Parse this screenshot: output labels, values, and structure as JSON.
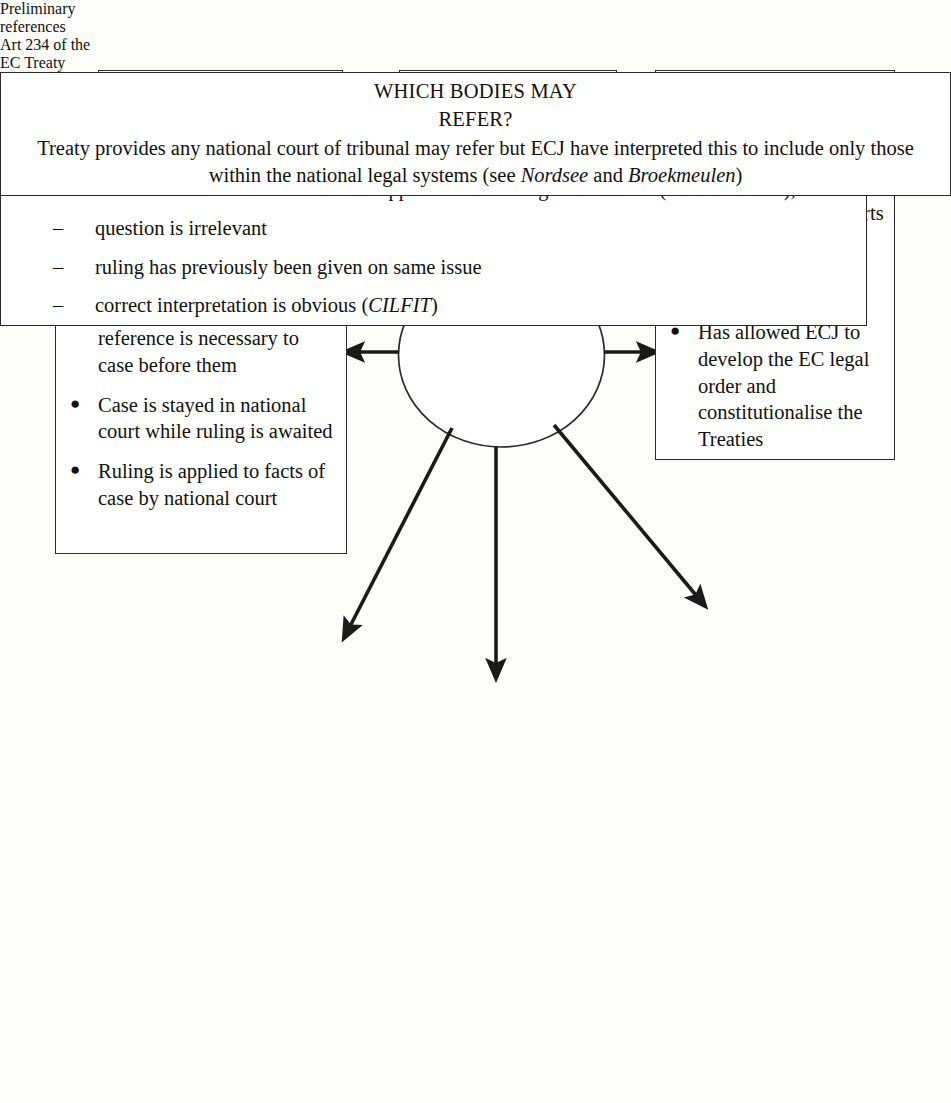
{
  "diagram": {
    "title": "Preliminary references Art 234 of the EC Treaty",
    "center": {
      "name": "center-node",
      "lines": [
        "Preliminary",
        "references",
        "Art 234 of the",
        "EC Treaty"
      ]
    },
    "nodes": {
      "purpose": {
        "heading": "PURPOSE:",
        "body_parts": [
          {
            "text": "To ensure ",
            "italic": false
          },
          {
            "text": "uniformity",
            "italic": true
          },
          {
            "text": " of interpretation and application of EC law",
            "italic": false
          }
        ],
        "body_plain": "To ensure uniformity of interpretation and application of EC law"
      },
      "effects": {
        "heading": "EFFECTS:",
        "body_plain": "Ruling provided by the ECJ binds the national court that referred"
      },
      "consequences": {
        "heading": "CONSEQUENCES:",
        "bullets": [
          "Creates a link between national courts and ECJ",
          "Allows national courts to familiarise themselves with EC law",
          "Has allowed ECJ to develop the EC legal order and constitutionalise the Treaties"
        ],
        "bullet_mark": "●"
      },
      "procedure": {
        "heading": "PROCEDURE:",
        "bullets": [
          "National court decides reference is necessary to case before them",
          "Case is stayed in national court while ruling is awaited",
          "Ruling is applied to facts of case by national court"
        ],
        "bullet_mark": "●"
      },
      "refuse": {
        "heading_line1": "CAN THE ECJ REFUSE A",
        "heading_line2": "REFERENCE?",
        "body_parts": [
          {
            "text": "Only if there has been an abuse of the reference procedure by the national court (see, for example, ",
            "italic": false
          },
          {
            "text": "Foglia Nos 1 and 2",
            "italic": true
          },
          {
            "text": " and ",
            "italic": false
          },
          {
            "text": "Meilicke",
            "italic": true
          },
          {
            "text": ")",
            "italic": false
          }
        ],
        "body_plain": "Only if there has been an abuse of the reference procedure by the national court (see, for example, Foglia Nos 1 and 2 and Meilicke)"
      },
      "must": {
        "heading_line1": "MUST A REFERENCE BE",
        "heading_line2": "MADE?",
        "bullet_mark": "●",
        "dash_mark": "–",
        "bullets": [
          {
            "parts": [
              {
                "text": "Lower courts have ",
                "italic": false
              },
              {
                "text": "discretion",
                "italic": true
              }
            ],
            "plain": "Lower courts have discretion"
          },
          {
            "parts": [
              {
                "text": "Courts from which there is no automatic appeal have an obligation to refer (",
                "italic": false
              },
              {
                "text": "Costa v ENEL",
                "italic": true
              },
              {
                "text": "), unless:",
                "italic": false
              }
            ],
            "plain": "Courts from which there is no automatic appeal have an obligation to refer (Costa v ENEL), unless:",
            "subbullets": [
              {
                "parts": [
                  {
                    "text": "question is irrelevant",
                    "italic": false
                  }
                ],
                "plain": "question is irrelevant"
              },
              {
                "parts": [
                  {
                    "text": "ruling has previously been given on same issue",
                    "italic": false
                  }
                ],
                "plain": "ruling has previously been given on same issue"
              },
              {
                "parts": [
                  {
                    "text": "correct interpretation is obvious (",
                    "italic": false
                  },
                  {
                    "text": "CILFIT",
                    "italic": true
                  },
                  {
                    "text": ")",
                    "italic": false
                  }
                ],
                "plain": "correct interpretation is obvious (CILFIT)"
              }
            ]
          }
        ]
      },
      "which": {
        "heading_line1": "WHICH BODIES MAY",
        "heading_line2": "REFER?",
        "body_parts": [
          {
            "text": "Treaty provides any national court of tribunal may refer but ECJ have interpreted this to include only those within the national legal systems (see ",
            "italic": false
          },
          {
            "text": "Nordsee",
            "italic": true
          },
          {
            "text": " and ",
            "italic": false
          },
          {
            "text": "Broekmeulen",
            "italic": true
          },
          {
            "text": ")",
            "italic": false
          }
        ],
        "body_plain": "Treaty provides any national court of tribunal may refer but ECJ have interpreted this to include only those within the national legal systems (see Nordsee and Broekmeulen)"
      }
    },
    "connectors": [
      {
        "name": "arrow-center-to-purpose",
        "from": "center",
        "to": "purpose",
        "direction": "up-left"
      },
      {
        "name": "arrow-center-to-effects",
        "from": "center",
        "to": "effects",
        "direction": "up"
      },
      {
        "name": "arrow-center-to-consequences",
        "from": "center",
        "to": "consequences",
        "direction": "right"
      },
      {
        "name": "arrow-center-to-procedure",
        "from": "center",
        "to": "procedure",
        "direction": "left"
      },
      {
        "name": "arrow-center-to-refuse",
        "from": "center",
        "to": "refuse",
        "direction": "down-left"
      },
      {
        "name": "arrow-center-to-must",
        "from": "center",
        "to": "must",
        "direction": "down"
      },
      {
        "name": "arrow-center-to-which",
        "from": "center",
        "to": "which",
        "direction": "down-right"
      }
    ],
    "colors": {
      "stroke": "#2a2a2a",
      "text": "#111111",
      "background": "#fdfdfc"
    }
  }
}
